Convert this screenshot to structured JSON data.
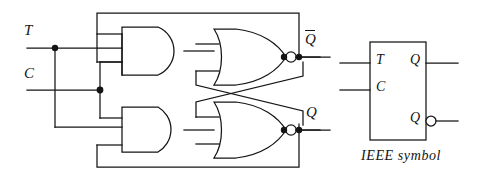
{
  "figure": {
    "type": "logic-circuit-schematic",
    "line_color": "#141414",
    "background": "#ffffff"
  },
  "gate_circuit": {
    "inputs": [
      {
        "id": "T",
        "label": "T"
      },
      {
        "id": "C",
        "label": "C"
      }
    ],
    "outputs": [
      {
        "id": "Qbar",
        "label": "Q",
        "overbar": true
      },
      {
        "id": "Q",
        "label": "Q",
        "overbar": false
      }
    ],
    "gates": [
      {
        "id": "and-top",
        "type": "AND",
        "inputs": 3
      },
      {
        "id": "and-bottom",
        "type": "AND",
        "inputs": 3
      },
      {
        "id": "nor-top",
        "type": "NOR",
        "inputs": 2
      },
      {
        "id": "nor-bottom",
        "type": "NOR",
        "inputs": 2
      }
    ],
    "junction_dots": 6,
    "feedback": [
      "Qbar output routed along top back to upper AND gate input",
      "Q output routed along bottom back to lower AND gate input",
      "NOR outputs cross-coupled to opposite NOR inputs"
    ]
  },
  "ieee_symbol": {
    "caption": "IEEE  symbol",
    "inputs": [
      {
        "id": "T",
        "label": "T"
      },
      {
        "id": "C",
        "label": "C"
      }
    ],
    "outputs": [
      {
        "id": "Q",
        "label": "Q",
        "inverting": false
      },
      {
        "id": "Qnot",
        "label": "Q",
        "inverting": true
      }
    ]
  }
}
